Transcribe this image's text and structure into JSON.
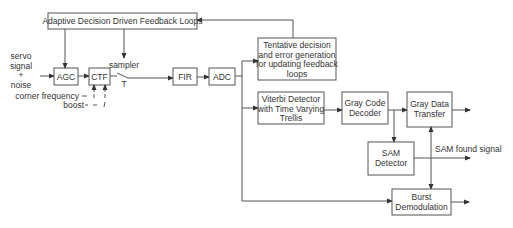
{
  "diagram": {
    "blocks": {
      "adaptive": {
        "label": "Adaptive Decision Driven Feedback Loops"
      },
      "agc": {
        "label": "AGC"
      },
      "ctf": {
        "label": "CTF"
      },
      "fir": {
        "label": "FIR"
      },
      "adc": {
        "label": "ADC"
      },
      "tentative": {
        "lines": [
          "Tentative decision",
          "and error generation",
          "for updating feedback",
          "loops"
        ]
      },
      "viterbi": {
        "lines": [
          "Viterbi Detector",
          "with Time Varying",
          "Trellis"
        ]
      },
      "gray_code": {
        "lines": [
          "Gray Code",
          "Decoder"
        ]
      },
      "gray_data": {
        "lines": [
          "Gray Data",
          "Transfer"
        ]
      },
      "sam": {
        "lines": [
          "SAM",
          "Detector"
        ]
      },
      "burst": {
        "lines": [
          "Burst",
          "Demodulation"
        ]
      }
    },
    "labels": {
      "input": [
        "servo",
        "signal",
        "+",
        "noise"
      ],
      "sampler": "sampler",
      "sampler_period": "T",
      "corner_frequency": "corner frequency",
      "boost": "boost",
      "sam_found": "SAM found signal"
    },
    "colors": {
      "stroke": "#555555",
      "text": "#333333",
      "background": "#ffffff"
    }
  }
}
